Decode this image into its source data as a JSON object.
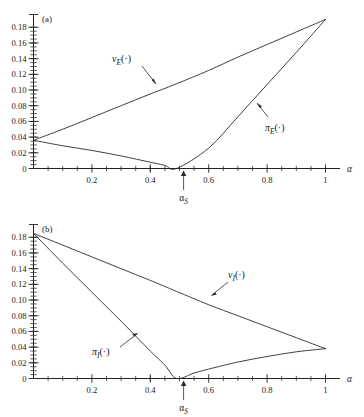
{
  "figure": {
    "background_color": "#ffffff",
    "ink_color": "#222222"
  },
  "panels": [
    {
      "tag": "(a)",
      "x_axis_name": "α",
      "x_tick_labels": [
        "0.2",
        "0.4",
        "0.6",
        "0.8",
        "1"
      ],
      "y_tick_labels": [
        "0",
        "0.02",
        "0.04",
        "0.06",
        "0.08",
        "0.10",
        "0.12",
        "0.14",
        "0.16",
        "0.18"
      ],
      "zero_label": "0",
      "alpha_s_label": "α",
      "alpha_s_sub": "S",
      "curves": [
        {
          "name": "v_E",
          "label_main": "v",
          "label_sub": "E",
          "label_paren": "(·)"
        },
        {
          "name": "pi_E",
          "label_main": "π",
          "label_sub": "E",
          "label_paren": "(·)"
        }
      ]
    },
    {
      "tag": "(b)",
      "x_axis_name": "α",
      "x_tick_labels": [
        "0.2",
        "0.4",
        "0.6",
        "0.8",
        "1"
      ],
      "y_tick_labels": [
        "0",
        "0.02",
        "0.04",
        "0.06",
        "0.08",
        "0.10",
        "0.12",
        "0.14",
        "0.16",
        "0.18"
      ],
      "zero_label": "0",
      "alpha_s_label": "α",
      "alpha_s_sub": "S",
      "curves": [
        {
          "name": "v_I",
          "label_main": "v",
          "label_sub": "I",
          "label_paren": "(·)"
        },
        {
          "name": "pi_I",
          "label_main": "π",
          "label_sub": "I",
          "label_paren": "(·)"
        }
      ]
    }
  ],
  "chart_data": [
    {
      "type": "line",
      "title": "(a)",
      "xlabel": "α",
      "ylabel": "",
      "xlim": [
        0,
        1.06
      ],
      "ylim": [
        0,
        0.195
      ],
      "x_ticks": [
        0.2,
        0.4,
        0.6,
        0.8,
        1.0
      ],
      "x_tick_labels": [
        "0.2",
        "0.4",
        "0.6",
        "0.8",
        "1"
      ],
      "x_minor_tick_step": 0.05,
      "y_ticks": [
        0,
        0.02,
        0.04,
        0.06,
        0.08,
        0.1,
        0.12,
        0.14,
        0.16,
        0.18
      ],
      "y_tick_labels": [
        "0",
        "0.02",
        "0.04",
        "0.06",
        "0.08",
        "0.10",
        "0.12",
        "0.14",
        "0.16",
        "0.18"
      ],
      "y_minor_tick_step": 0.005,
      "grid": false,
      "legend": "none",
      "annotations": [
        {
          "text": "α_S",
          "x": 0.49,
          "y": 0,
          "kind": "axis-arrow-below"
        },
        {
          "text": "v_E(·)",
          "x": 0.28,
          "y": 0.128,
          "kind": "leader-label"
        },
        {
          "text": "π_E(·)",
          "x": 0.8,
          "y": 0.065,
          "kind": "leader-label"
        }
      ],
      "series": [
        {
          "name": "v_E(·)",
          "x": [
            0.0,
            0.1,
            0.2,
            0.3,
            0.4,
            0.49,
            0.6,
            0.7,
            0.8,
            0.9,
            1.0
          ],
          "values": [
            0.036,
            0.05,
            0.065,
            0.08,
            0.095,
            0.108,
            0.125,
            0.142,
            0.158,
            0.174,
            0.19
          ]
        },
        {
          "name": "π_E(·)",
          "x": [
            0.0,
            0.1,
            0.2,
            0.3,
            0.4,
            0.45,
            0.49,
            0.6,
            0.7,
            0.8,
            0.9,
            1.0
          ],
          "values": [
            0.036,
            0.029,
            0.023,
            0.016,
            0.008,
            0.004,
            0.0,
            0.026,
            0.066,
            0.107,
            0.148,
            0.19
          ]
        }
      ]
    },
    {
      "type": "line",
      "title": "(b)",
      "xlabel": "α",
      "ylabel": "",
      "xlim": [
        0,
        1.06
      ],
      "ylim": [
        0,
        0.195
      ],
      "x_ticks": [
        0.2,
        0.4,
        0.6,
        0.8,
        1.0
      ],
      "x_tick_labels": [
        "0.2",
        "0.4",
        "0.6",
        "0.8",
        "1"
      ],
      "x_minor_tick_step": 0.05,
      "y_ticks": [
        0,
        0.02,
        0.04,
        0.06,
        0.08,
        0.1,
        0.12,
        0.14,
        0.16,
        0.18
      ],
      "y_tick_labels": [
        "0",
        "0.02",
        "0.04",
        "0.06",
        "0.08",
        "0.10",
        "0.12",
        "0.14",
        "0.16",
        "0.18"
      ],
      "y_minor_tick_step": 0.005,
      "grid": false,
      "legend": "none",
      "annotations": [
        {
          "text": "α_S",
          "x": 0.49,
          "y": 0,
          "kind": "axis-arrow-below"
        },
        {
          "text": "v_I(·)",
          "x": 0.7,
          "y": 0.125,
          "kind": "leader-label"
        },
        {
          "text": "π_I(·)",
          "x": 0.22,
          "y": 0.045,
          "kind": "leader-label"
        }
      ],
      "series": [
        {
          "name": "v_I(·)",
          "x": [
            0.0,
            0.1,
            0.2,
            0.3,
            0.4,
            0.49,
            0.6,
            0.7,
            0.8,
            0.9,
            1.0
          ],
          "values": [
            0.185,
            0.17,
            0.155,
            0.14,
            0.125,
            0.111,
            0.094,
            0.08,
            0.066,
            0.052,
            0.038
          ]
        },
        {
          "name": "π_I(·)",
          "x": [
            0.0,
            0.1,
            0.2,
            0.3,
            0.4,
            0.45,
            0.49,
            0.55,
            0.6,
            0.7,
            0.8,
            0.9,
            1.0
          ],
          "values": [
            0.185,
            0.147,
            0.11,
            0.073,
            0.035,
            0.017,
            0.0,
            0.007,
            0.012,
            0.021,
            0.028,
            0.034,
            0.038
          ]
        }
      ]
    }
  ]
}
